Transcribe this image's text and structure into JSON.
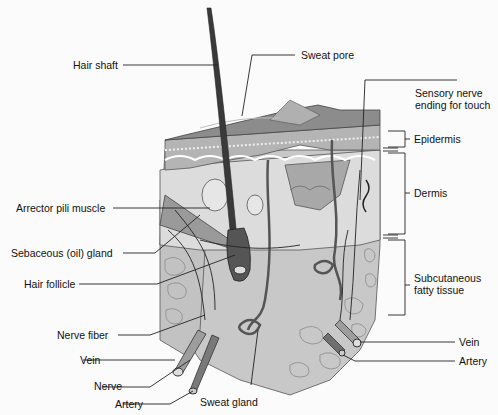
{
  "diagram": {
    "colors": {
      "background": "#fbfbfb",
      "surface": "#8a8a8a",
      "epidermis": "#bdbdbd",
      "dermis": "#d6d6d6",
      "fat": "#c4c4c4",
      "line": "#1a1a1a",
      "hair": "#333333"
    },
    "labels_left": [
      {
        "id": "hair-shaft",
        "text": "Hair shaft"
      },
      {
        "id": "arrector-pili-muscle",
        "text": "Arrector pili muscle"
      },
      {
        "id": "sebaceous-gland",
        "text": "Sebaceous (oil) gland"
      },
      {
        "id": "hair-follicle",
        "text": "Hair follicle"
      },
      {
        "id": "nerve-fiber",
        "text": "Nerve fiber"
      },
      {
        "id": "vein-left",
        "text": "Vein"
      },
      {
        "id": "nerve",
        "text": "Nerve"
      },
      {
        "id": "artery-left",
        "text": "Artery"
      }
    ],
    "labels_top": [
      {
        "id": "sweat-pore",
        "text": "Sweat pore"
      },
      {
        "id": "sensory-nerve",
        "text": "Sensory nerve\nending for touch"
      }
    ],
    "labels_right": [
      {
        "id": "epidermis",
        "text": "Epidermis"
      },
      {
        "id": "dermis",
        "text": "Dermis"
      },
      {
        "id": "subcutaneous",
        "text": "Subcutaneous\nfatty tissue"
      },
      {
        "id": "vein-right",
        "text": "Vein"
      },
      {
        "id": "artery-right",
        "text": "Artery"
      }
    ],
    "labels_bottom": [
      {
        "id": "sweat-gland",
        "text": "Sweat gland"
      }
    ]
  }
}
